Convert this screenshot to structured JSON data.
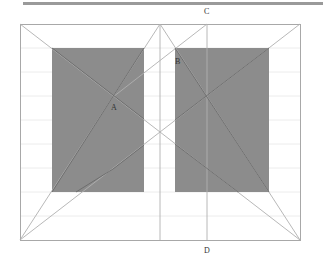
{
  "diagram": {
    "type": "geometric construction / page layout canon",
    "labels": {
      "A": "A",
      "B": "B",
      "C": "C",
      "D": "D"
    },
    "colors": {
      "frame": "#a8a8a8",
      "block_fill": "#8c8c8c",
      "gridline": "#ececec",
      "topbar": "#9a9a9a",
      "line": "#b0b0b0",
      "line_dark": "#666666"
    },
    "frame": {
      "x1": 20,
      "y1": 24,
      "x2": 300,
      "y2": 240
    },
    "blocks": [
      {
        "name": "left-block",
        "x": 52,
        "y": 48,
        "w": 92,
        "h": 144
      },
      {
        "name": "right-block",
        "x": 175,
        "y": 48,
        "w": 94,
        "h": 144
      }
    ],
    "points": {
      "A": [
        113,
        97
      ],
      "B": [
        175,
        48
      ],
      "C": [
        207,
        24
      ],
      "D": [
        207,
        240
      ]
    }
  }
}
